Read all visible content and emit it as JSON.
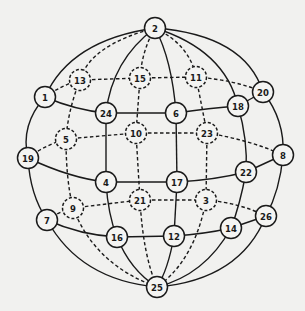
{
  "colors": {
    "background": "#f1f1ef",
    "stroke": "#1a1a1a",
    "node_fill": "#f4f4f2"
  },
  "nodes": [
    {
      "id": "2",
      "x": 155,
      "y": 28,
      "style": "solid"
    },
    {
      "id": "13",
      "x": 80,
      "y": 80,
      "style": "dashed"
    },
    {
      "id": "15",
      "x": 140,
      "y": 78,
      "style": "dashed"
    },
    {
      "id": "11",
      "x": 196,
      "y": 77,
      "style": "dashed"
    },
    {
      "id": "20",
      "x": 263,
      "y": 92,
      "style": "solid"
    },
    {
      "id": "1",
      "x": 45,
      "y": 97,
      "style": "solid"
    },
    {
      "id": "24",
      "x": 106,
      "y": 113,
      "style": "solid"
    },
    {
      "id": "6",
      "x": 176,
      "y": 113,
      "style": "solid"
    },
    {
      "id": "18",
      "x": 238,
      "y": 106,
      "style": "solid"
    },
    {
      "id": "5",
      "x": 66,
      "y": 139,
      "style": "dashed"
    },
    {
      "id": "10",
      "x": 136,
      "y": 133,
      "style": "dashed"
    },
    {
      "id": "23",
      "x": 207,
      "y": 133,
      "style": "dashed"
    },
    {
      "id": "8",
      "x": 283,
      "y": 155,
      "style": "solid"
    },
    {
      "id": "19",
      "x": 28,
      "y": 158,
      "style": "solid"
    },
    {
      "id": "4",
      "x": 106,
      "y": 182,
      "style": "solid"
    },
    {
      "id": "17",
      "x": 177,
      "y": 182,
      "style": "solid"
    },
    {
      "id": "22",
      "x": 246,
      "y": 172,
      "style": "solid"
    },
    {
      "id": "21",
      "x": 140,
      "y": 200,
      "style": "dashed"
    },
    {
      "id": "9",
      "x": 73,
      "y": 208,
      "style": "dashed"
    },
    {
      "id": "3",
      "x": 206,
      "y": 200,
      "style": "dashed"
    },
    {
      "id": "26",
      "x": 266,
      "y": 216,
      "style": "solid"
    },
    {
      "id": "7",
      "x": 47,
      "y": 220,
      "style": "solid"
    },
    {
      "id": "16",
      "x": 117,
      "y": 237,
      "style": "solid"
    },
    {
      "id": "12",
      "x": 174,
      "y": 236,
      "style": "solid"
    },
    {
      "id": "14",
      "x": 231,
      "y": 228,
      "style": "solid"
    },
    {
      "id": "25",
      "x": 157,
      "y": 287,
      "style": "solid"
    }
  ],
  "edges": [
    {
      "d": "M155,28 Q70,40 45,97",
      "style": "solid"
    },
    {
      "d": "M45,97 Q20,125 28,158",
      "style": "solid"
    },
    {
      "d": "M28,158 Q30,195 47,220",
      "style": "solid"
    },
    {
      "d": "M47,220 Q80,280 157,287",
      "style": "solid"
    },
    {
      "d": "M155,28 Q245,35 263,92",
      "style": "solid"
    },
    {
      "d": "M263,92 Q285,120 283,155",
      "style": "solid"
    },
    {
      "d": "M283,155 Q280,190 266,216",
      "style": "solid"
    },
    {
      "d": "M266,216 Q240,280 157,287",
      "style": "solid"
    },
    {
      "d": "M155,28 Q112,60 106,113",
      "style": "solid"
    },
    {
      "d": "M106,113 L106,182",
      "style": "solid"
    },
    {
      "d": "M106,182 Q108,215 117,237",
      "style": "solid"
    },
    {
      "d": "M117,237 Q130,270 157,287",
      "style": "solid"
    },
    {
      "d": "M155,28 Q172,60 176,113",
      "style": "solid"
    },
    {
      "d": "M176,113 L177,182",
      "style": "solid"
    },
    {
      "d": "M177,182 L174,236",
      "style": "solid"
    },
    {
      "d": "M174,236 Q168,270 157,287",
      "style": "solid"
    },
    {
      "d": "M155,28 Q225,50 238,106",
      "style": "solid"
    },
    {
      "d": "M238,106 Q248,140 246,172",
      "style": "solid"
    },
    {
      "d": "M246,172 Q240,205 231,228",
      "style": "solid"
    },
    {
      "d": "M231,228 Q205,275 157,287",
      "style": "solid"
    },
    {
      "d": "M45,97 Q75,110 106,113",
      "style": "solid"
    },
    {
      "d": "M106,113 L176,113",
      "style": "solid"
    },
    {
      "d": "M176,113 Q210,108 238,106",
      "style": "solid"
    },
    {
      "d": "M238,106 L263,92",
      "style": "solid"
    },
    {
      "d": "M28,158 Q70,178 106,182",
      "style": "solid"
    },
    {
      "d": "M106,182 L177,182",
      "style": "solid"
    },
    {
      "d": "M177,182 Q215,180 246,172",
      "style": "solid"
    },
    {
      "d": "M246,172 L283,155",
      "style": "solid"
    },
    {
      "d": "M47,220 Q80,235 117,237",
      "style": "solid"
    },
    {
      "d": "M117,237 L174,236",
      "style": "solid"
    },
    {
      "d": "M174,236 Q205,234 231,228",
      "style": "solid"
    },
    {
      "d": "M231,228 L266,216",
      "style": "solid"
    },
    {
      "d": "M155,28 Q90,45 80,80",
      "style": "dashed"
    },
    {
      "d": "M80,80 Q68,110 66,139",
      "style": "dashed"
    },
    {
      "d": "M66,139 Q66,180 73,208",
      "style": "dashed"
    },
    {
      "d": "M73,208 Q95,265 157,287",
      "style": "dashed"
    },
    {
      "d": "M155,28 Q142,50 140,78",
      "style": "dashed"
    },
    {
      "d": "M140,78 L136,133",
      "style": "dashed"
    },
    {
      "d": "M136,133 L140,200",
      "style": "dashed"
    },
    {
      "d": "M140,200 Q143,255 157,287",
      "style": "dashed"
    },
    {
      "d": "M155,28 Q190,45 196,77",
      "style": "dashed"
    },
    {
      "d": "M196,77 L207,133",
      "style": "dashed"
    },
    {
      "d": "M207,133 L206,200",
      "style": "dashed"
    },
    {
      "d": "M206,200 Q195,260 157,287",
      "style": "dashed"
    },
    {
      "d": "M45,97 Q62,85 80,80",
      "style": "dashed"
    },
    {
      "d": "M80,80 L140,78",
      "style": "dashed"
    },
    {
      "d": "M140,78 L196,77",
      "style": "dashed"
    },
    {
      "d": "M196,77 Q235,80 263,92",
      "style": "dashed"
    },
    {
      "d": "M28,158 Q45,145 66,139",
      "style": "dashed"
    },
    {
      "d": "M66,139 L136,133",
      "style": "dashed"
    },
    {
      "d": "M136,133 L207,133",
      "style": "dashed"
    },
    {
      "d": "M207,133 Q250,140 283,155",
      "style": "dashed"
    },
    {
      "d": "M47,220 Q58,212 73,208",
      "style": "dashed"
    },
    {
      "d": "M73,208 L140,200",
      "style": "dashed"
    },
    {
      "d": "M140,200 L206,200",
      "style": "dashed"
    },
    {
      "d": "M206,200 Q240,203 266,216",
      "style": "dashed"
    }
  ]
}
